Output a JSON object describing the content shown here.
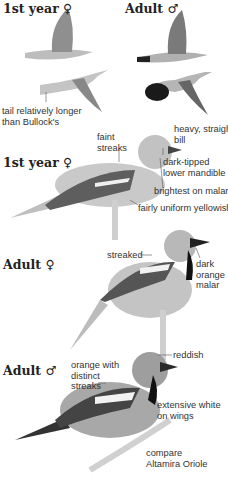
{
  "flight_section": {
    "left_label": "1st year ♀",
    "right_label": "Adult ♂",
    "annotation": "tail relatively longer than Bullock's",
    "annotation_lines": [
      "tail relatively longer",
      "than Bullock's"
    ]
  },
  "first_year_female": {
    "label": "1st year ♀",
    "annotations": {
      "faint_streaks": [
        "faint",
        "streaks"
      ],
      "bill": [
        "heavy, straight",
        "bill"
      ],
      "mandible": [
        "dark-tipped",
        "lower mandible"
      ],
      "malar": [
        "brightest on malar"
      ],
      "body": [
        "fairly uniform yellowish"
      ]
    }
  },
  "adult_female": {
    "label": "Adult ♀",
    "annotations": {
      "streaked": [
        "streaked"
      ],
      "malar": [
        "dark",
        "orange",
        "malar"
      ]
    }
  },
  "adult_male": {
    "label": "Adult ♂",
    "annotations": {
      "reddish": [
        "reddish"
      ],
      "streaks": [
        "orange with",
        "distinct",
        "streaks"
      ],
      "wings": [
        "extensive white",
        "on wings"
      ],
      "compare": [
        "compare",
        "Altamira Oriole"
      ]
    }
  },
  "colors": {
    "ink": "#222222",
    "bird_light": "#c8c8c8",
    "bird_mid": "#9a9a9a",
    "bird_dark": "#333333"
  }
}
